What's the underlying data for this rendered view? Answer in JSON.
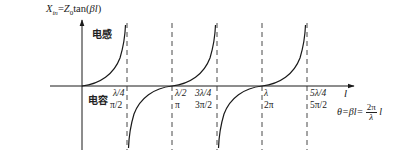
{
  "diagram": {
    "title_formula": {
      "lhs": "X",
      "lhs_sub": "in",
      "equals": "=",
      "z": "Z",
      "z_sub": "0",
      "func": "tan(",
      "arg": "βl",
      "close": ")"
    },
    "regions": {
      "inductive": "电感",
      "capacitive": "电容"
    },
    "x_axis_label": "l",
    "ticks": [
      {
        "length": "λ/4",
        "angle": "π/2"
      },
      {
        "length": "λ/2",
        "angle": "π"
      },
      {
        "length": "3λ/4",
        "angle": "3π/2"
      },
      {
        "length": "λ",
        "angle": "2π"
      },
      {
        "length": "5λ/4",
        "angle": "5π/2"
      }
    ],
    "theta_formula": {
      "lhs": "θ=βl=",
      "num": "2π",
      "den": "λ",
      "tail": "l"
    },
    "colors": {
      "curve": "#1a1a1a",
      "axis": "#1a1a1a",
      "dashed": "#333333"
    }
  }
}
